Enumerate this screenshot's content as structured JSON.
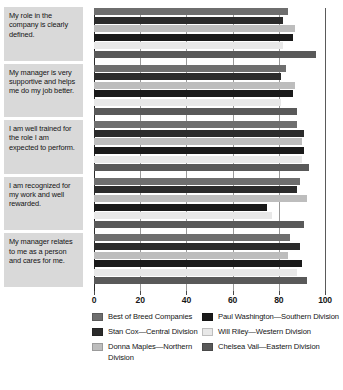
{
  "chart_data": {
    "type": "bar",
    "orientation": "horizontal",
    "title": "",
    "xlabel": "",
    "ylabel": "",
    "xlim": [
      0,
      100
    ],
    "xticks": [
      0,
      20,
      40,
      60,
      80,
      100
    ],
    "grid": true,
    "legend_position": "bottom",
    "categories": [
      "My role in the company is clearly defined.",
      "My manager is very supportive and helps me do my job better.",
      "I am well trained for the role I am expected to perform.",
      "I am recognized for my work and well rewarded.",
      "My manager relates to me as a person and cares for me."
    ],
    "series": [
      {
        "name": "Best of Breed Companies",
        "color": "#6e6e6e",
        "values": [
          84,
          83,
          88,
          89,
          85
        ]
      },
      {
        "name": "Stan Cox—Central Division",
        "color": "#2b2b2b",
        "values": [
          82,
          81,
          91,
          88,
          89
        ]
      },
      {
        "name": "Donna Maples—Northern Division",
        "color": "#bdbdbd",
        "values": [
          87,
          87,
          90,
          92,
          84
        ]
      },
      {
        "name": "Paul Washington—Southern Division",
        "color": "#1a1a1a",
        "values": [
          86,
          86,
          91,
          75,
          90
        ]
      },
      {
        "name": "Will Riley—Western Division",
        "color": "#e8e8e8",
        "values": [
          82,
          81,
          90,
          77,
          88
        ]
      },
      {
        "name": "Chelsea Vail—Eastern Division",
        "color": "#595959",
        "values": [
          96,
          88,
          93,
          91,
          92
        ]
      }
    ]
  },
  "legend": {
    "columns": [
      {
        "items": [
          {
            "label": "Best of Breed Companies",
            "color": "#6e6e6e"
          },
          {
            "label": "Stan Cox—Central Division",
            "color": "#2b2b2b"
          },
          {
            "label": "Donna Maples—Northern Division",
            "color": "#bdbdbd"
          }
        ]
      },
      {
        "items": [
          {
            "label": "Paul Washington—Southern Division",
            "color": "#1a1a1a"
          },
          {
            "label": "Will Riley—Western Division",
            "color": "#e8e8e8"
          },
          {
            "label": "Chelsea Vail—Eastern Division",
            "color": "#595959"
          }
        ]
      }
    ]
  }
}
